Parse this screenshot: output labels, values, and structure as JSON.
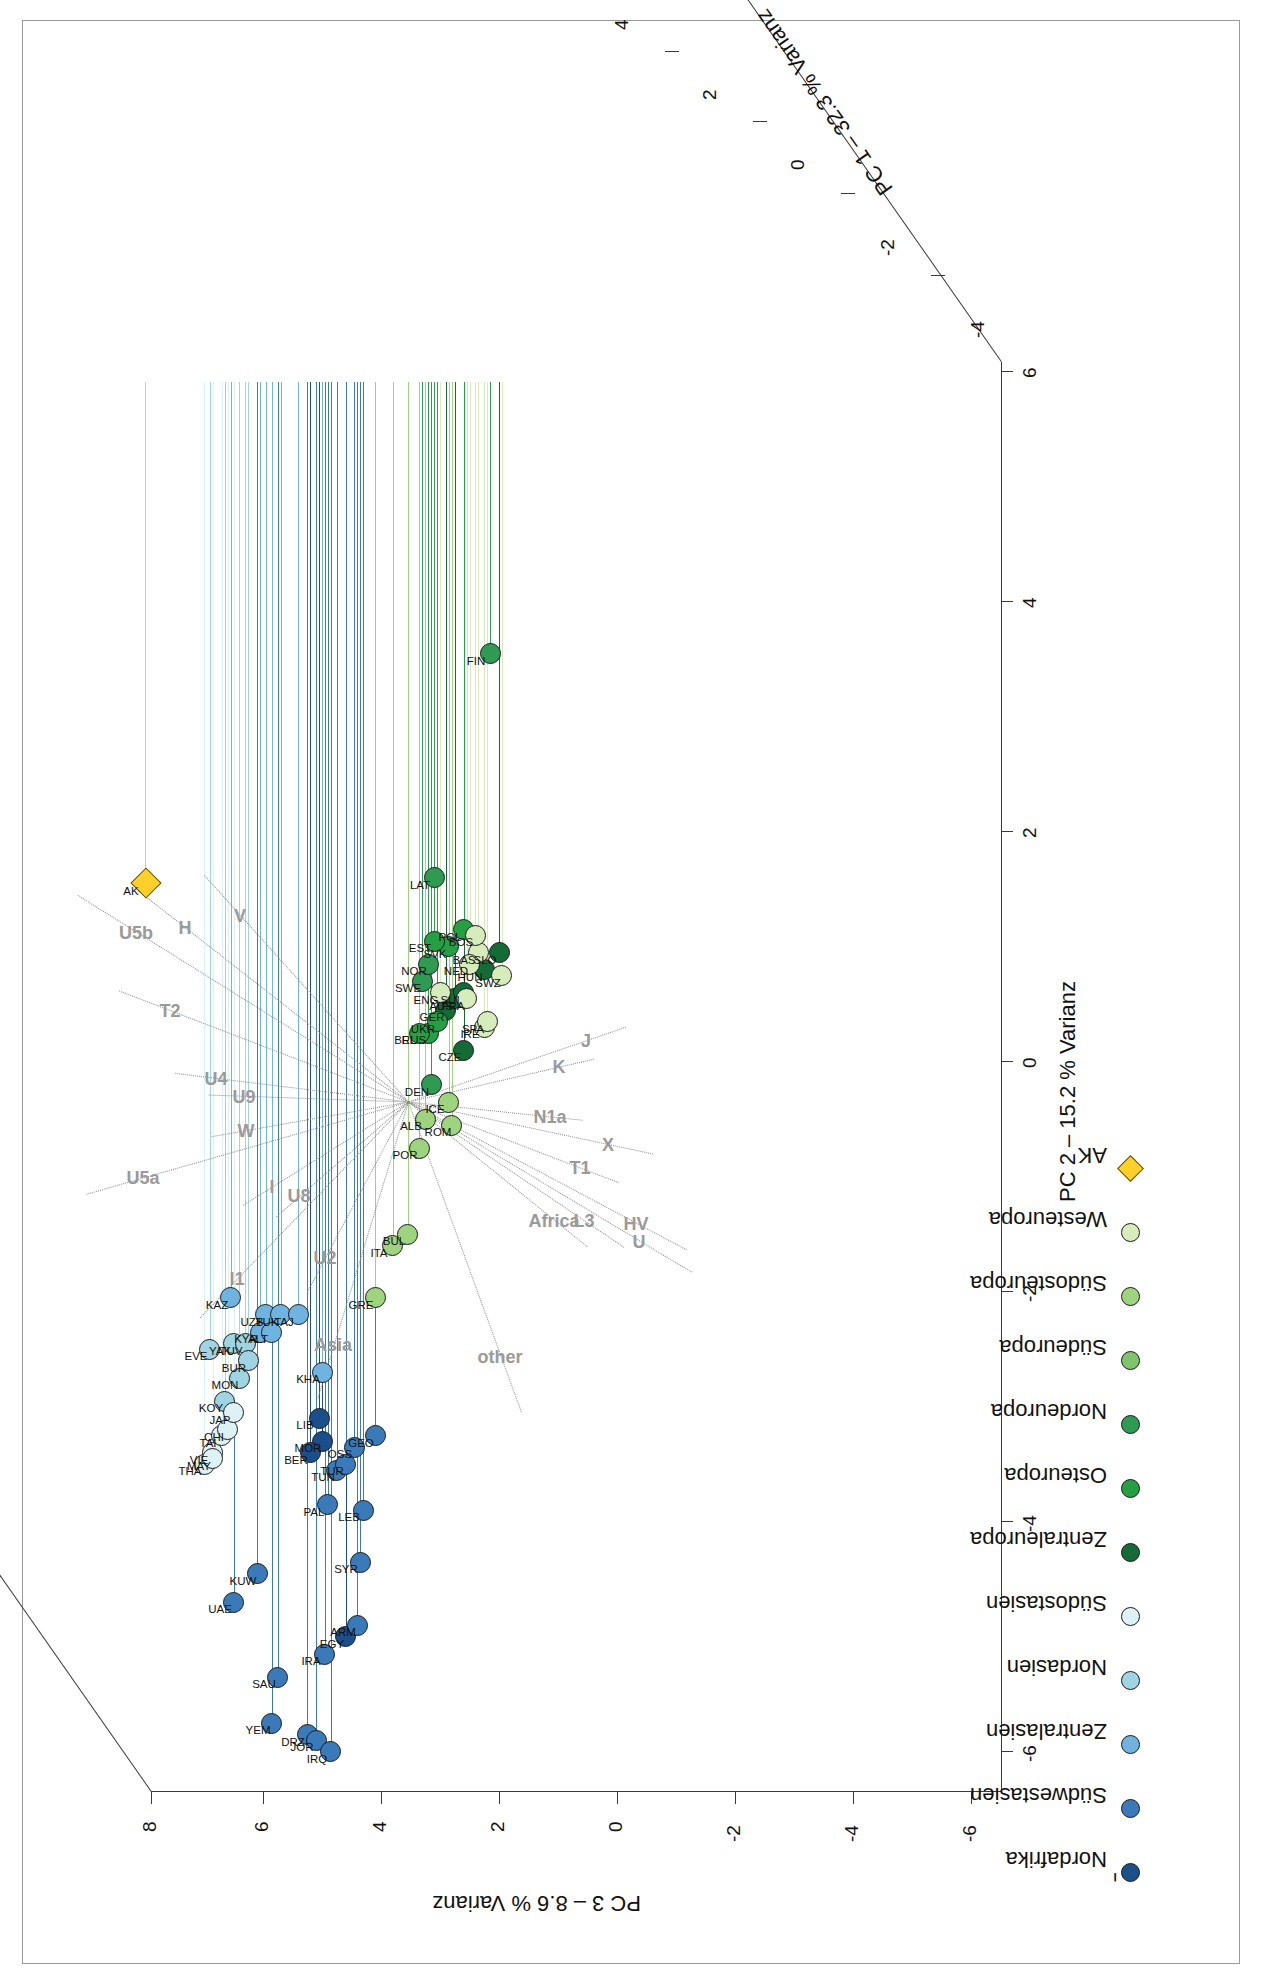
{
  "figure": {
    "type": "pca-3d-scatter-biplot",
    "orientation": "rotated-90-ccw"
  },
  "chart_data": {
    "type": "scatter",
    "title": "",
    "xlabel": "PC 2 – 15.2 % Varianz",
    "ylabel": "PC 3 – 8.6 % Varianz",
    "zlabel": "PC 1 – 32.3 % Varianz",
    "xlim": [
      -6,
      6
    ],
    "ylim": [
      -6,
      8
    ],
    "zlim": [
      -6,
      6
    ],
    "xticks": [
      "-6",
      "-4",
      "-2",
      "0",
      "2",
      "4",
      "6"
    ],
    "yticks": [
      "-6",
      "-4",
      "-2",
      "0",
      "2",
      "4",
      "6",
      "8"
    ],
    "zticks": [
      "-4",
      "-2",
      "0",
      "2",
      "4",
      "6"
    ],
    "grid": false,
    "legend_position": "bottom-left",
    "series": [
      {
        "name": "Nordafrika",
        "color": "#1b4f8c",
        "points": [
          {
            "label": "EGY",
            "x": -5.0,
            "y": 4.6
          },
          {
            "label": "MOR",
            "x": -3.3,
            "y": 5.0
          },
          {
            "label": "LIB",
            "x": -3.1,
            "y": 5.05
          },
          {
            "label": "BER",
            "x": -3.4,
            "y": 5.2
          }
        ]
      },
      {
        "name": "Südwestasien",
        "color": "#3a7ab8",
        "points": [
          {
            "label": "UAE",
            "x": -4.7,
            "y": 6.5
          },
          {
            "label": "KUW",
            "x": -4.45,
            "y": 6.1
          },
          {
            "label": "SAU",
            "x": -5.35,
            "y": 5.75
          },
          {
            "label": "YEM",
            "x": -5.75,
            "y": 5.85
          },
          {
            "label": "DRZ",
            "x": -5.85,
            "y": 5.25
          },
          {
            "label": "JOR",
            "x": -5.9,
            "y": 5.1
          },
          {
            "label": "IRQ",
            "x": -6.0,
            "y": 4.85
          },
          {
            "label": "IRA",
            "x": -5.15,
            "y": 4.95
          },
          {
            "label": "ARM",
            "x": -4.9,
            "y": 4.4
          },
          {
            "label": "SYR",
            "x": -4.35,
            "y": 4.35
          },
          {
            "label": "PAL",
            "x": -3.85,
            "y": 4.9
          },
          {
            "label": "TUN",
            "x": -3.55,
            "y": 4.75
          },
          {
            "label": "TUR",
            "x": -3.5,
            "y": 4.6
          },
          {
            "label": "LEB",
            "x": -3.9,
            "y": 4.3
          },
          {
            "label": "GEO",
            "x": -3.25,
            "y": 4.1
          },
          {
            "label": "OSS",
            "x": -3.35,
            "y": 4.45
          }
        ]
      },
      {
        "name": "Zentralasien",
        "color": "#6fb4e0",
        "points": [
          {
            "label": "KAZ",
            "x": -2.05,
            "y": 6.55
          },
          {
            "label": "UZB",
            "x": -2.2,
            "y": 5.95
          },
          {
            "label": "TUK",
            "x": -2.2,
            "y": 5.7
          },
          {
            "label": "TAJ",
            "x": -2.2,
            "y": 5.4
          },
          {
            "label": "KHA",
            "x": -2.7,
            "y": 5.0
          },
          {
            "label": "KYR",
            "x": -2.35,
            "y": 6.05
          },
          {
            "label": "ALT",
            "x": -2.35,
            "y": 5.85
          }
        ]
      },
      {
        "name": "Nordasien",
        "color": "#9fd4e2",
        "points": [
          {
            "label": "EVE",
            "x": -2.5,
            "y": 6.9
          },
          {
            "label": "YAK",
            "x": -2.45,
            "y": 6.5
          },
          {
            "label": "TUV",
            "x": -2.45,
            "y": 6.3
          },
          {
            "label": "BUR",
            "x": -2.6,
            "y": 6.25
          },
          {
            "label": "MON",
            "x": -2.75,
            "y": 6.4
          },
          {
            "label": "KOY",
            "x": -2.95,
            "y": 6.65
          }
        ]
      },
      {
        "name": "Südostasien",
        "color": "#ddf2f5",
        "points": [
          {
            "label": "VIE",
            "x": -3.4,
            "y": 6.85
          },
          {
            "label": "TAI",
            "x": -3.25,
            "y": 6.7
          },
          {
            "label": "CHI",
            "x": -3.2,
            "y": 6.6
          },
          {
            "label": "THA",
            "x": -3.5,
            "y": 7.0
          },
          {
            "label": "MAY",
            "x": -3.45,
            "y": 6.85
          },
          {
            "label": "JAP",
            "x": -3.05,
            "y": 6.5
          }
        ]
      },
      {
        "name": "Zentraleuropa",
        "color": "#146b35",
        "points": [
          {
            "label": "GER",
            "x": 0.45,
            "y": 2.9
          },
          {
            "label": "AUS",
            "x": 0.55,
            "y": 2.75
          },
          {
            "label": "SUI",
            "x": 0.6,
            "y": 2.6
          },
          {
            "label": "HUN",
            "x": 0.8,
            "y": 2.25
          },
          {
            "label": "SLO",
            "x": 0.95,
            "y": 2.0
          },
          {
            "label": "CZE",
            "x": 0.1,
            "y": 2.6
          }
        ]
      },
      {
        "name": "Osteuropa",
        "color": "#24a043",
        "points": [
          {
            "label": "RUS",
            "x": 0.25,
            "y": 3.2
          },
          {
            "label": "UKR",
            "x": 0.35,
            "y": 3.05
          },
          {
            "label": "BEL",
            "x": 0.25,
            "y": 3.35
          },
          {
            "label": "POL",
            "x": 1.15,
            "y": 2.6
          },
          {
            "label": "SVK",
            "x": 1.0,
            "y": 2.85
          },
          {
            "label": "EST",
            "x": 1.05,
            "y": 3.1
          }
        ]
      },
      {
        "name": "Nordeuropa",
        "color": "#2e9a52",
        "points": [
          {
            "label": "FIN",
            "x": 3.55,
            "y": 2.15
          },
          {
            "label": "SWE",
            "x": 0.7,
            "y": 3.3
          },
          {
            "label": "DEN",
            "x": -0.2,
            "y": 3.15
          },
          {
            "label": "LAT",
            "x": 1.6,
            "y": 3.1
          },
          {
            "label": "NOR",
            "x": 0.85,
            "y": 3.2
          }
        ]
      },
      {
        "name": "Südeuropa",
        "color": "#7ec46a"
      },
      {
        "name": "Südosteuropa",
        "color": "#9fd47f",
        "points": [
          {
            "label": "ITA",
            "x": -1.6,
            "y": 3.8
          },
          {
            "label": "BUL",
            "x": -1.5,
            "y": 3.55
          },
          {
            "label": "POR",
            "x": -0.75,
            "y": 3.35
          },
          {
            "label": "ROM",
            "x": -0.55,
            "y": 2.8
          },
          {
            "label": "ICE",
            "x": -0.35,
            "y": 2.85
          },
          {
            "label": "ALB",
            "x": -0.5,
            "y": 3.25
          },
          {
            "label": "GRE",
            "x": -2.05,
            "y": 4.1
          }
        ]
      },
      {
        "name": "Westeuropa",
        "color": "#d6ecba",
        "points": [
          {
            "label": "FRA",
            "x": 0.55,
            "y": 2.55
          },
          {
            "label": "IRE",
            "x": 0.3,
            "y": 2.25
          },
          {
            "label": "SPA",
            "x": 0.35,
            "y": 2.2
          },
          {
            "label": "ENG",
            "x": 0.6,
            "y": 3.0
          },
          {
            "label": "BAS",
            "x": 0.95,
            "y": 2.35
          },
          {
            "label": "BOS",
            "x": 1.1,
            "y": 2.4
          },
          {
            "label": "SWZ",
            "x": 0.75,
            "y": 1.95
          },
          {
            "label": "NED",
            "x": 0.85,
            "y": 2.5
          }
        ]
      },
      {
        "name": "AK",
        "color": "#ffd02a",
        "marker": "diamond",
        "points": [
          {
            "label": "AK",
            "x": 1.55,
            "y": 8.0
          }
        ]
      }
    ],
    "haplogroup_vectors": [
      {
        "label": "other",
        "angle_deg": 200,
        "length": 330
      },
      {
        "label": "Africa",
        "angle_deg": 231,
        "length": 230
      },
      {
        "label": "L3",
        "angle_deg": 236,
        "length": 260
      },
      {
        "label": "T1",
        "angle_deg": 249,
        "length": 225
      },
      {
        "label": "X",
        "angle_deg": 258,
        "length": 250
      },
      {
        "label": "N1a",
        "angle_deg": 264,
        "length": 175
      },
      {
        "label": "HV",
        "angle_deg": 242,
        "length": 315
      },
      {
        "label": "U",
        "angle_deg": 239,
        "length": 330
      },
      {
        "label": "J",
        "angle_deg": 289,
        "length": 230
      },
      {
        "label": "K",
        "angle_deg": 283,
        "length": 190
      },
      {
        "label": "Asia",
        "angle_deg": 163,
        "length": 310
      },
      {
        "label": "U2",
        "angle_deg": 152,
        "length": 215
      },
      {
        "label": "U8",
        "angle_deg": 131,
        "length": 175
      },
      {
        "label": "I",
        "angle_deg": 122,
        "length": 195
      },
      {
        "label": "I1",
        "angle_deg": 136,
        "length": 300
      },
      {
        "label": "W",
        "angle_deg": 100,
        "length": 200
      },
      {
        "label": "U9",
        "angle_deg": 88,
        "length": 200
      },
      {
        "label": "U4",
        "angle_deg": 83,
        "length": 235
      },
      {
        "label": "T2",
        "angle_deg": 69,
        "length": 310
      },
      {
        "label": "H",
        "angle_deg": 52,
        "length": 345
      },
      {
        "label": "V",
        "angle_deg": 42,
        "length": 305
      },
      {
        "label": "U5a",
        "angle_deg": 106,
        "length": 335
      },
      {
        "label": "U5b",
        "angle_deg": 58,
        "length": 390
      }
    ]
  },
  "legend": {
    "title": "–",
    "items": [
      {
        "label": "Nordafrika",
        "color": "#1b4f8c",
        "marker": "circle"
      },
      {
        "label": "Südwestasien",
        "color": "#3a7ab8",
        "marker": "circle"
      },
      {
        "label": "Zentralasien",
        "color": "#6fb4e0",
        "marker": "circle"
      },
      {
        "label": "Nordasien",
        "color": "#9fd4e2",
        "marker": "circle"
      },
      {
        "label": "Südostasien",
        "color": "#ddf2f5",
        "marker": "circle"
      },
      {
        "label": "Zentraleuropa",
        "color": "#146b35",
        "marker": "circle"
      },
      {
        "label": "Osteuropa",
        "color": "#24a043",
        "marker": "circle"
      },
      {
        "label": "Nordeuropa",
        "color": "#2e9a52",
        "marker": "circle"
      },
      {
        "label": "Südeuropa",
        "color": "#7ec46a",
        "marker": "circle"
      },
      {
        "label": "Südosteuropa",
        "color": "#9fd47f",
        "marker": "circle"
      },
      {
        "label": "Westeuropa",
        "color": "#d6ecba",
        "marker": "circle"
      },
      {
        "label": "AK",
        "color": "#ffd02a",
        "marker": "diamond"
      }
    ]
  }
}
